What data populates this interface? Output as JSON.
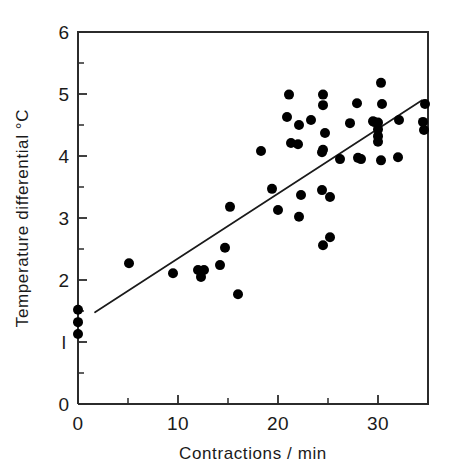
{
  "chart_data": {
    "type": "scatter",
    "title": "",
    "xlabel": "Contractions / min",
    "ylabel": "Temperature differential °C",
    "xlim": [
      0,
      35
    ],
    "ylim": [
      0,
      6
    ],
    "grid": false,
    "legend": "none",
    "x_ticks_major": [
      0,
      10,
      20,
      30
    ],
    "x_tick_labels": [
      "0",
      "10",
      "20",
      "30"
    ],
    "x_ticks_minor": [
      5,
      15,
      25,
      35
    ],
    "y_ticks_major": [
      0,
      1,
      2,
      3,
      4,
      5,
      6
    ],
    "y_tick_labels": [
      "0",
      "l",
      "2",
      "3",
      "4",
      "5",
      "6"
    ],
    "y_ticks_minor": [
      0.5,
      1.5,
      2.5,
      3.5,
      4.5,
      5.5
    ],
    "marker": "filled-circle",
    "marker_color": "#000000",
    "marker_size_px": 5,
    "points": [
      [
        0.0,
        1.52
      ],
      [
        0.0,
        1.32
      ],
      [
        0.0,
        1.13
      ],
      [
        5.1,
        2.27
      ],
      [
        9.5,
        2.11
      ],
      [
        12.0,
        2.16
      ],
      [
        12.3,
        2.05
      ],
      [
        12.6,
        2.16
      ],
      [
        14.2,
        2.24
      ],
      [
        14.7,
        2.52
      ],
      [
        15.2,
        3.18
      ],
      [
        16.0,
        1.77
      ],
      [
        18.3,
        4.08
      ],
      [
        19.4,
        3.47
      ],
      [
        20.0,
        3.13
      ],
      [
        20.9,
        4.63
      ],
      [
        21.1,
        4.99
      ],
      [
        21.3,
        4.21
      ],
      [
        22.1,
        4.5
      ],
      [
        22.1,
        3.02
      ],
      [
        22.3,
        3.37
      ],
      [
        22.0,
        4.19
      ],
      [
        23.3,
        4.58
      ],
      [
        24.4,
        4.06
      ],
      [
        24.5,
        4.99
      ],
      [
        24.5,
        4.82
      ],
      [
        24.5,
        4.1
      ],
      [
        24.5,
        2.56
      ],
      [
        24.7,
        4.37
      ],
      [
        24.4,
        3.45
      ],
      [
        25.2,
        3.34
      ],
      [
        25.2,
        2.69
      ],
      [
        26.2,
        3.95
      ],
      [
        27.2,
        4.53
      ],
      [
        27.9,
        4.85
      ],
      [
        28.0,
        3.97
      ],
      [
        28.3,
        3.95
      ],
      [
        29.5,
        4.56
      ],
      [
        29.6,
        4.55
      ],
      [
        30.0,
        4.54
      ],
      [
        30.0,
        4.43
      ],
      [
        30.0,
        4.32
      ],
      [
        30.0,
        4.23
      ],
      [
        30.3,
        5.18
      ],
      [
        30.4,
        4.84
      ],
      [
        30.3,
        3.93
      ],
      [
        32.0,
        3.98
      ],
      [
        32.1,
        4.58
      ],
      [
        34.5,
        4.55
      ],
      [
        34.6,
        4.42
      ],
      [
        34.7,
        4.84
      ]
    ],
    "trend_line": {
      "label": "regression line",
      "x_start": 1.7,
      "y_start": 1.48,
      "x_end": 34.4,
      "y_end": 4.9
    },
    "annotations": []
  },
  "figure": {
    "background_color": "#ffffff",
    "axis_color": "#2b2b2b",
    "data_color": "#000000"
  }
}
